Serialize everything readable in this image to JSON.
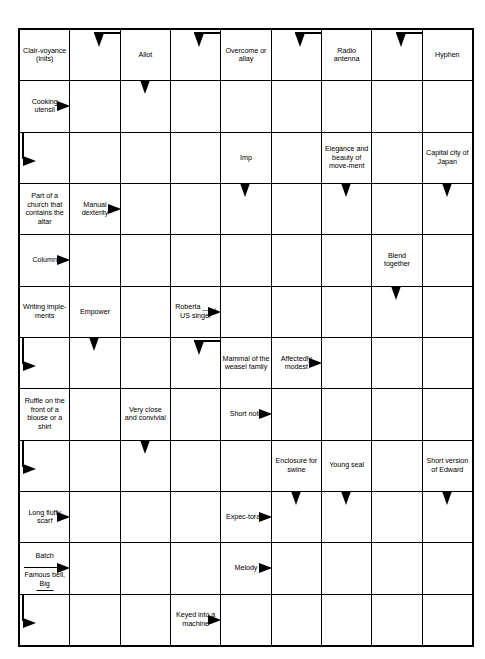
{
  "puzzle": {
    "type": "arrowword",
    "columns": 9,
    "rows": 12,
    "ink_color": "#000000",
    "paper_color": "#ffffff",
    "cells": [
      [
        {
          "clue": "Clair-voyance (inits)"
        },
        {
          "arrow": "corner-right-down"
        },
        {
          "clue": "Allot"
        },
        {
          "arrow": "corner-right-down"
        },
        {
          "clue": "Overcome or allay"
        },
        {
          "arrow": "corner-right-down"
        },
        {
          "clue": "Radio antenna"
        },
        {
          "arrow": "corner-right-down"
        },
        {
          "clue": "Hyphen"
        }
      ],
      [
        {
          "clue": "Cooking utensil",
          "arrow": "right"
        },
        {},
        {
          "arrow": "down"
        },
        {},
        {},
        {},
        {},
        {},
        {}
      ],
      [
        {
          "arrow": "corner-down-right"
        },
        {},
        {},
        {},
        {
          "clue": "Imp"
        },
        {},
        {
          "clue": "Elegance and beauty of move-ment"
        },
        {},
        {
          "clue": "Capital city of Japan"
        }
      ],
      [
        {
          "clue": "Part of a church that contains the altar"
        },
        {
          "clue": "Manual dexterity",
          "arrow": "right"
        },
        {},
        {},
        {
          "arrow": "down"
        },
        {},
        {
          "arrow": "down"
        },
        {},
        {
          "arrow": "down"
        }
      ],
      [
        {
          "clue": "Column",
          "arrow": "right"
        },
        {},
        {},
        {},
        {},
        {},
        {},
        {
          "clue": "Blend together"
        },
        {}
      ],
      [
        {
          "clue": "Writing imple-ments"
        },
        {
          "clue": "Empower"
        },
        {},
        {
          "clue": "Roberta ___, US singer",
          "arrow": "right"
        },
        {},
        {},
        {},
        {
          "arrow": "down"
        },
        {}
      ],
      [
        {
          "arrow": "corner-down-right"
        },
        {
          "arrow": "down"
        },
        {},
        {
          "arrow": "corner-right-down"
        },
        {
          "clue": "Mammal of the weasel family"
        },
        {
          "clue": "Affectedly modest",
          "arrow": "right"
        },
        {},
        {},
        {}
      ],
      [
        {
          "clue": "Ruffle on the front of a blouse or a shirt"
        },
        {},
        {
          "clue": "Very close and convivial"
        },
        {},
        {
          "clue": "Short note",
          "arrow": "right"
        },
        {},
        {},
        {},
        {}
      ],
      [
        {
          "arrow": "corner-down-right"
        },
        {},
        {
          "arrow": "down"
        },
        {},
        {},
        {
          "clue": "Enclosure for swine"
        },
        {
          "clue": "Young seal"
        },
        {},
        {
          "clue": "Short version of Edward"
        }
      ],
      [
        {
          "clue": "Long fluffy scarf",
          "arrow": "right"
        },
        {},
        {},
        {},
        {
          "clue": "Expec-torate",
          "arrow": "right"
        },
        {
          "arrow": "down"
        },
        {
          "arrow": "down"
        },
        {},
        {
          "arrow": "down"
        }
      ],
      [
        {
          "clue_top": "Batch",
          "clue_bottom": "Famous bell, Big",
          "blank_rule": true,
          "arrow": "right"
        },
        {},
        {},
        {},
        {
          "clue": "Melody",
          "arrow": "right"
        },
        {},
        {},
        {},
        {}
      ],
      [
        {
          "arrow": "corner-down-right"
        },
        {},
        {},
        {
          "clue": "Keyed into a machine",
          "arrow": "right"
        },
        {},
        {},
        {},
        {},
        {}
      ]
    ]
  }
}
